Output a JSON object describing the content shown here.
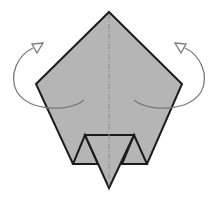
{
  "diagram": {
    "colors": {
      "paper_fill": "#b5b5b5",
      "edge_stroke": "#1c1c1c",
      "arrow_stroke": "#7a7a7a",
      "crease_stroke": "#8a8a8a"
    },
    "elements": {
      "pentagon": "paper pentagon",
      "crease": "mountain fold crease (dash-dot)",
      "flap": "bottom pointed flap",
      "arrow_left": "fold-behind arrow (left)",
      "arrow_right": "fold-behind arrow (right)"
    }
  }
}
